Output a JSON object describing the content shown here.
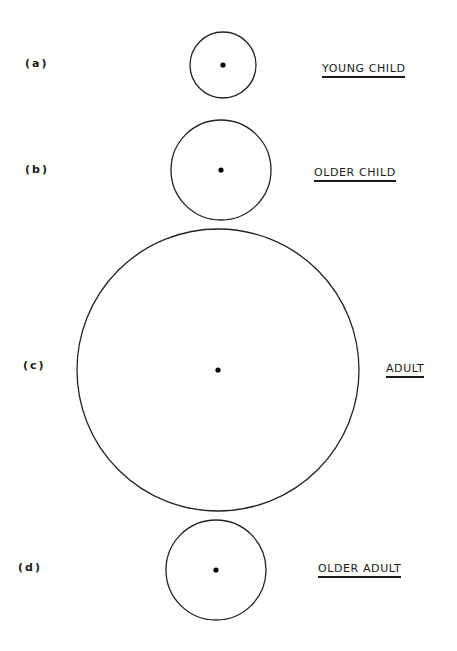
{
  "figure": {
    "stroke_color": "#222222",
    "background": "#ffffff",
    "panels": [
      {
        "letter": "(a)",
        "label": "YOUNG CHILD",
        "circle": {
          "cx": 223,
          "cy": 65,
          "r": 33
        }
      },
      {
        "letter": "(b)",
        "label": "OLDER CHILD",
        "circle": {
          "cx": 221,
          "cy": 170,
          "r": 50
        }
      },
      {
        "letter": "(c)",
        "label": "ADULT",
        "circle": {
          "cx": 218,
          "cy": 370,
          "r": 141
        }
      },
      {
        "letter": "(d)",
        "label": "OLDER ADULT",
        "circle": {
          "cx": 216,
          "cy": 570,
          "r": 50
        }
      }
    ]
  }
}
